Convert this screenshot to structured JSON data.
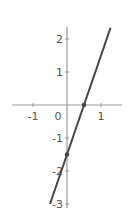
{
  "chart_data": {
    "type": "line",
    "title": "",
    "xlabel": "",
    "ylabel": "",
    "xlim": [
      -1.6,
      1.6
    ],
    "ylim": [
      -3,
      2.4
    ],
    "grid": false,
    "x_ticks": [
      -1,
      0,
      1
    ],
    "y_ticks": [
      -3,
      -2,
      -1,
      1,
      2
    ],
    "x_tick_labels": [
      "-1",
      "0",
      "1"
    ],
    "y_tick_labels": [
      "-3",
      "-2",
      "-1",
      "1",
      "2"
    ],
    "series": [
      {
        "name": "y = 3x - 1.5",
        "x": [
          -0.5,
          1.28
        ],
        "y": [
          -3,
          2.34
        ],
        "color": "#444444"
      }
    ],
    "points": [
      {
        "label": "x-intercept",
        "x": 0.5,
        "y": 0
      },
      {
        "label": "y-intercept",
        "x": 0,
        "y": -1.5
      }
    ]
  },
  "colors": {
    "axis": "#999999",
    "line": "#444444",
    "text": "#555555"
  }
}
